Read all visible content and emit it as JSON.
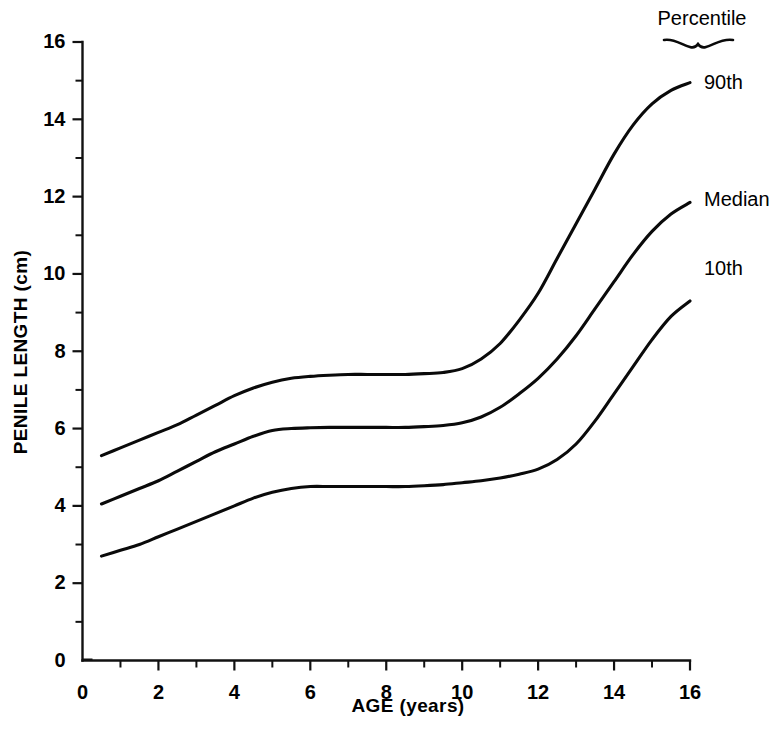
{
  "chart_data": {
    "type": "line",
    "title": "",
    "xlabel": "AGE (years)",
    "ylabel": "PENILE LENGTH (cm)",
    "xlim": [
      0,
      16
    ],
    "ylim": [
      0,
      16
    ],
    "x_major_ticks": [
      0,
      2,
      4,
      6,
      8,
      10,
      12,
      14,
      16
    ],
    "x_minor_ticks": [
      1,
      3,
      5,
      7,
      9,
      11,
      13,
      15
    ],
    "y_major_ticks": [
      0,
      2,
      4,
      6,
      8,
      10,
      12,
      14,
      16
    ],
    "y_minor_ticks": [
      1,
      3,
      5,
      7,
      9,
      11,
      13,
      15
    ],
    "x_tick_labels": [
      "0",
      "2",
      "4",
      "6",
      "8",
      "10",
      "12",
      "14",
      "16"
    ],
    "y_tick_labels": [
      "0",
      "2",
      "4",
      "6",
      "8",
      "10",
      "12",
      "14",
      "16"
    ],
    "grid": false,
    "legend_position": "right-inline",
    "legend_title": "Percentile",
    "x": [
      0.5,
      1,
      1.5,
      2,
      2.5,
      3,
      3.5,
      4,
      4.5,
      5,
      5.5,
      6,
      6.5,
      7,
      7.5,
      8,
      8.5,
      9,
      9.5,
      10,
      10.5,
      11,
      11.5,
      12,
      12.5,
      13,
      13.5,
      14,
      14.5,
      15,
      15.5,
      16
    ],
    "series": [
      {
        "name": "90th",
        "label": "90th",
        "color": "#0a0a0a",
        "values": [
          5.3,
          5.5,
          5.7,
          5.9,
          6.1,
          6.35,
          6.6,
          6.85,
          7.05,
          7.2,
          7.3,
          7.35,
          7.38,
          7.4,
          7.4,
          7.4,
          7.4,
          7.42,
          7.45,
          7.55,
          7.8,
          8.2,
          8.8,
          9.5,
          10.4,
          11.3,
          12.2,
          13.1,
          13.85,
          14.4,
          14.75,
          14.95
        ]
      },
      {
        "name": "Median",
        "label": "Median",
        "color": "#0a0a0a",
        "values": [
          4.05,
          4.25,
          4.45,
          4.65,
          4.9,
          5.15,
          5.4,
          5.6,
          5.8,
          5.95,
          6.0,
          6.02,
          6.03,
          6.03,
          6.03,
          6.03,
          6.03,
          6.05,
          6.08,
          6.15,
          6.3,
          6.55,
          6.9,
          7.3,
          7.8,
          8.4,
          9.1,
          9.8,
          10.5,
          11.1,
          11.55,
          11.85
        ]
      },
      {
        "name": "10th",
        "label": "10th",
        "color": "#0a0a0a",
        "values": [
          2.7,
          2.85,
          3.0,
          3.2,
          3.4,
          3.6,
          3.8,
          4.0,
          4.2,
          4.35,
          4.45,
          4.5,
          4.5,
          4.5,
          4.5,
          4.5,
          4.5,
          4.52,
          4.55,
          4.6,
          4.65,
          4.72,
          4.82,
          4.95,
          5.2,
          5.6,
          6.2,
          6.9,
          7.6,
          8.3,
          8.9,
          9.3
        ]
      }
    ]
  },
  "axes": {
    "y_label_text": "PENILE LENGTH (cm)",
    "x_label_text": "AGE (years)"
  },
  "legend": {
    "title": "Percentile",
    "entries": [
      "90th",
      "Median",
      "10th"
    ]
  }
}
